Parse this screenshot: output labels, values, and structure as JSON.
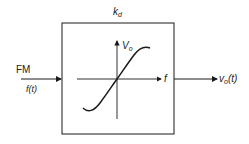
{
  "block": {
    "gain_label": "k",
    "gain_subscript": "d"
  },
  "input": {
    "name": "FM",
    "signal": "f(t)"
  },
  "output": {
    "signal_main": "v",
    "signal_subscript": "o",
    "signal_arg": "(t)"
  },
  "characteristic": {
    "y_axis_main": "V",
    "y_axis_subscript": "o",
    "x_axis": "f",
    "shape": "s-curve"
  },
  "colors": {
    "line": "#1a1a1a",
    "background": "#ffffff"
  }
}
